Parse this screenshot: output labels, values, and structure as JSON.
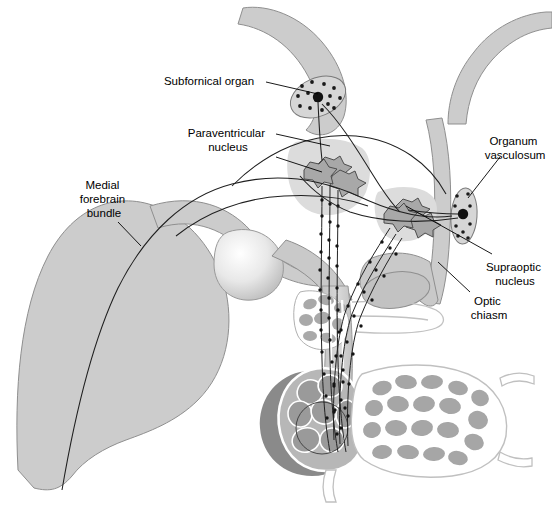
{
  "figure": {
    "background_color": "#ffffff"
  },
  "palette": {
    "brain_fill": "#cccccc",
    "brain_stroke": "#8c8c8c",
    "nucleus_halo": "#d9d9d9",
    "cell_body_fill": "#a8a8a8",
    "cell_body_stroke": "#4d4d4d",
    "cvo_fill": "#d6d6d6",
    "cvo_stroke": "#7a7a7a",
    "dot_color": "#1a1a1a",
    "fiber_color": "#222222",
    "posterior_lobe_dark": "#8a8a8a",
    "vessel_lumen": "#a3a3a3",
    "vessel_wall": "#ffffff",
    "outline": "#777777",
    "text_color": "#000000",
    "leader_color": "#000000"
  },
  "labels": [
    {
      "id": "subfornical-organ",
      "text": "Subfornical organ",
      "lines": [
        "Subfornical organ"
      ],
      "x": 209,
      "y": 82,
      "anchor": "middle"
    },
    {
      "id": "paraventricular-nucleus",
      "text": "Paraventricular nucleus",
      "lines": [
        "Paraventricular",
        "nucleus"
      ],
      "x": 228,
      "y": 141,
      "anchor": "middle"
    },
    {
      "id": "medial-forebrain-bundle",
      "text": "Medial forebrain bundle",
      "lines": [
        "Medial",
        "forebrain",
        "bundle"
      ],
      "x": 104,
      "y": 200,
      "anchor": "middle"
    },
    {
      "id": "organum-vasculosum",
      "text": "Organum vasculosum",
      "lines": [
        "Organum",
        "vasculosum"
      ],
      "x": 515,
      "y": 142,
      "anchor": "middle"
    },
    {
      "id": "supraoptic-nucleus",
      "text": "Supraoptic nucleus",
      "lines": [
        "Supraoptic",
        "nucleus"
      ],
      "x": 515,
      "y": 268,
      "anchor": "middle"
    },
    {
      "id": "optic-chiasm",
      "text": "Optic chiasm",
      "lines": [
        "Optic",
        "chiasm"
      ],
      "x": 489,
      "y": 302,
      "anchor": "middle"
    }
  ],
  "leaders": [
    {
      "id": "leader-subfornical-organ",
      "path": "M 266 82 L 318 94"
    },
    {
      "id": "leader-paraventricular-1",
      "path": "M 276 134 L 330 146"
    },
    {
      "id": "leader-paraventricular-2",
      "path": "M 276 157 L 322 172"
    },
    {
      "id": "leader-medial-forebrain-bundle",
      "path": "M 118 222 L 141 245"
    },
    {
      "id": "leader-organum-vasculosum",
      "path": "M 500 157 L 468 196"
    },
    {
      "id": "leader-supraoptic-nucleus",
      "path": "M 492 254 L 404 205"
    },
    {
      "id": "leader-optic-chiasm",
      "path": "M 470 292 L 440 264"
    }
  ],
  "structures": [
    {
      "id": "corpus-callosum-fornix-band",
      "name": "corpus callosum / fornix band"
    },
    {
      "id": "lamina-terminalis-band",
      "name": "lamina terminalis band"
    },
    {
      "id": "forebrain-mass",
      "name": "forebrain mass"
    },
    {
      "id": "thalamus-bulge",
      "name": "thalamus bulge"
    },
    {
      "id": "hypothalamus-floor",
      "name": "hypothalamus floor"
    },
    {
      "id": "infundibular-stalk",
      "name": "infundibular stalk"
    },
    {
      "id": "median-eminence",
      "name": "median eminence"
    },
    {
      "id": "posterior-pituitary",
      "name": "posterior pituitary (neurohypophysis)"
    },
    {
      "id": "anterior-pituitary",
      "name": "anterior pituitary (adenohypophysis)"
    },
    {
      "id": "optic-chiasm-body",
      "name": "optic chiasm"
    },
    {
      "id": "subfornical-organ-body",
      "name": "subfornical organ"
    },
    {
      "id": "organum-vasculosum-body",
      "name": "organum vasculosum of lamina terminalis"
    },
    {
      "id": "paraventricular-nucleus-body",
      "name": "paraventricular nucleus"
    },
    {
      "id": "supraoptic-nucleus-body",
      "name": "supraoptic nucleus"
    },
    {
      "id": "medial-forebrain-bundle-tract",
      "name": "medial forebrain bundle tract"
    }
  ]
}
